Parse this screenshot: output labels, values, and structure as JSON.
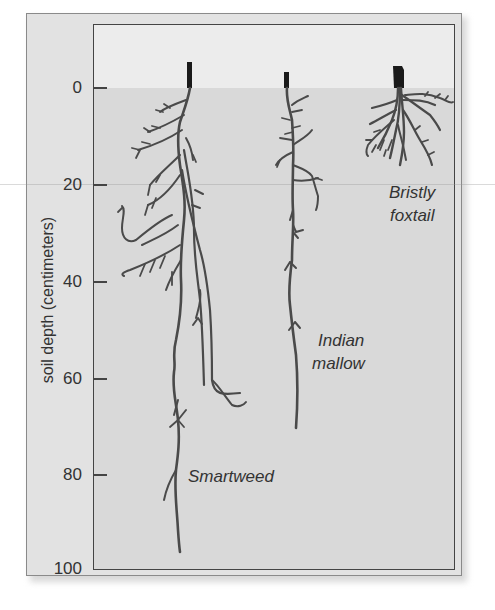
{
  "figure": {
    "y_axis": {
      "label": "soil depth (centimeters)",
      "ticks": [
        "0",
        "20",
        "40",
        "60",
        "80",
        "100"
      ],
      "range_cm": [
        0,
        100
      ]
    },
    "species": [
      {
        "name": "Smartweed",
        "approx_max_root_depth_cm": 97
      },
      {
        "name": "Indian mallow",
        "approx_max_root_depth_cm": 71
      },
      {
        "name": "Bristly foxtail",
        "approx_max_root_depth_cm": 17
      }
    ],
    "labels": {
      "smartweed": "Smartweed",
      "indian_mallow_line1": "Indian",
      "indian_mallow_line2": "mallow",
      "bristly_foxtail_line1": "Bristly",
      "bristly_foxtail_line2": "foxtail"
    },
    "colors": {
      "root": "#4a4a4a",
      "stem": "#1a1a1a",
      "soil": "#d9d9d9",
      "air": "#ececec",
      "frame": "#e2e2e2"
    }
  }
}
